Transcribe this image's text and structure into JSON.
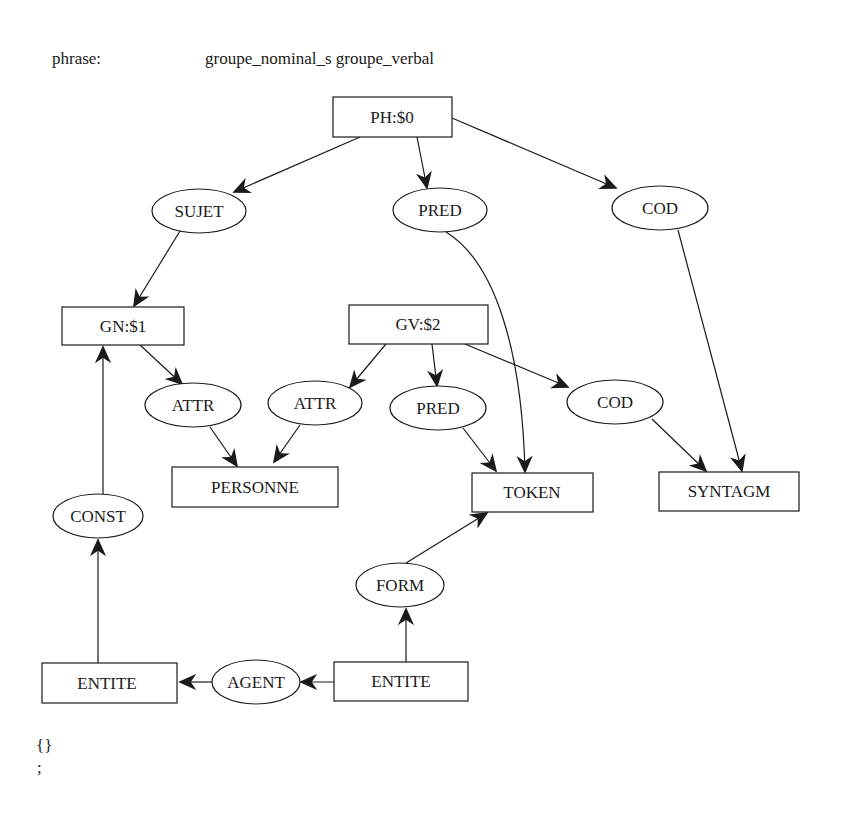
{
  "header": {
    "label": "phrase:",
    "rule": "groupe_nominal_s groupe_verbal"
  },
  "footer": {
    "braces": "{}",
    "terminator": ";"
  },
  "graph": {
    "nodes": {
      "ph": {
        "label": "PH:$0",
        "shape": "box"
      },
      "sujet": {
        "label": "SUJET",
        "shape": "ellipse"
      },
      "pred_top": {
        "label": "PRED",
        "shape": "ellipse"
      },
      "cod_top": {
        "label": "COD",
        "shape": "ellipse"
      },
      "gn": {
        "label": "GN:$1",
        "shape": "box"
      },
      "gv": {
        "label": "GV:$2",
        "shape": "box"
      },
      "attr_gn": {
        "label": "ATTR",
        "shape": "ellipse"
      },
      "attr_gv": {
        "label": "ATTR",
        "shape": "ellipse"
      },
      "pred_gv": {
        "label": "PRED",
        "shape": "ellipse"
      },
      "cod_gv": {
        "label": "COD",
        "shape": "ellipse"
      },
      "personne": {
        "label": "PERSONNE",
        "shape": "box"
      },
      "token": {
        "label": "TOKEN",
        "shape": "box"
      },
      "syntagm": {
        "label": "SYNTAGM",
        "shape": "box"
      },
      "const": {
        "label": "CONST",
        "shape": "ellipse"
      },
      "form": {
        "label": "FORM",
        "shape": "ellipse"
      },
      "entite_left": {
        "label": "ENTITE",
        "shape": "box"
      },
      "agent": {
        "label": "AGENT",
        "shape": "ellipse"
      },
      "entite_right": {
        "label": "ENTITE",
        "shape": "box"
      }
    },
    "edges": [
      {
        "from": "PH:$0",
        "to": "SUJET"
      },
      {
        "from": "PH:$0",
        "to": "PRED"
      },
      {
        "from": "PH:$0",
        "to": "COD"
      },
      {
        "from": "SUJET",
        "to": "GN:$1"
      },
      {
        "from": "PRED",
        "to": "TOKEN"
      },
      {
        "from": "COD",
        "to": "SYNTAGM"
      },
      {
        "from": "GN:$1",
        "to": "ATTR"
      },
      {
        "from": "GV:$2",
        "to": "ATTR"
      },
      {
        "from": "GV:$2",
        "to": "PRED"
      },
      {
        "from": "GV:$2",
        "to": "COD"
      },
      {
        "from": "ATTR",
        "to": "PERSONNE"
      },
      {
        "from": "ATTR",
        "to": "PERSONNE"
      },
      {
        "from": "PRED",
        "to": "TOKEN"
      },
      {
        "from": "COD",
        "to": "SYNTAGM"
      },
      {
        "from": "ENTITE",
        "to": "CONST"
      },
      {
        "from": "CONST",
        "to": "GN:$1"
      },
      {
        "from": "ENTITE",
        "to": "FORM"
      },
      {
        "from": "FORM",
        "to": "TOKEN"
      },
      {
        "from": "ENTITE",
        "to": "AGENT"
      },
      {
        "from": "AGENT",
        "to": "ENTITE"
      }
    ]
  }
}
